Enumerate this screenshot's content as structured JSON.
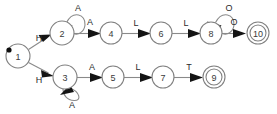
{
  "diagram": {
    "type": "state-machine",
    "background_color": "#ffffff",
    "node_stroke_color": "#808080",
    "edge_stroke_color": "#8a8a8a",
    "arrow_color": "#141414",
    "label_color": "#2a2a2a",
    "start_state": "1",
    "accepting_states": [
      "9",
      "10"
    ],
    "nodes": [
      {
        "id": "1",
        "label": "1",
        "cx": 18,
        "cy": 56,
        "r": 12,
        "accepting": false,
        "start": true
      },
      {
        "id": "2",
        "label": "2",
        "cx": 62,
        "cy": 33,
        "r": 12,
        "accepting": false,
        "start": false
      },
      {
        "id": "3",
        "label": "3",
        "cx": 65,
        "cy": 77,
        "r": 12,
        "accepting": false,
        "start": false
      },
      {
        "id": "4",
        "label": "4",
        "cx": 111,
        "cy": 33,
        "r": 11,
        "accepting": false,
        "start": false
      },
      {
        "id": "5",
        "label": "5",
        "cx": 113,
        "cy": 77,
        "r": 11,
        "accepting": false,
        "start": false
      },
      {
        "id": "6",
        "label": "6",
        "cx": 161,
        "cy": 33,
        "r": 11,
        "accepting": false,
        "start": false
      },
      {
        "id": "7",
        "label": "7",
        "cx": 163,
        "cy": 77,
        "r": 11,
        "accepting": false,
        "start": false
      },
      {
        "id": "8",
        "label": "8",
        "cx": 211,
        "cy": 33,
        "r": 11,
        "accepting": false,
        "start": false
      },
      {
        "id": "9",
        "label": "9",
        "cx": 214,
        "cy": 77,
        "r": 11,
        "accepting": true,
        "start": false
      },
      {
        "id": "10",
        "label": "10",
        "cx": 258,
        "cy": 33,
        "r": 11,
        "accepting": true,
        "start": false
      }
    ],
    "edges": [
      {
        "from": "1",
        "to": "2",
        "label": "H",
        "label_x": 39,
        "label_y": 38,
        "kind": "straight"
      },
      {
        "from": "1",
        "to": "3",
        "label": "H",
        "label_x": 39,
        "label_y": 80,
        "kind": "straight"
      },
      {
        "from": "2",
        "to": "2",
        "label": "A",
        "label_x": 78,
        "label_y": 8,
        "kind": "self-loop-up"
      },
      {
        "from": "2",
        "to": "4",
        "label": "A",
        "label_x": 90,
        "label_y": 22,
        "kind": "straight"
      },
      {
        "from": "4",
        "to": "6",
        "label": "L",
        "label_x": 136,
        "label_y": 23,
        "kind": "straight"
      },
      {
        "from": "6",
        "to": "8",
        "label": "L",
        "label_x": 186,
        "label_y": 23,
        "kind": "straight"
      },
      {
        "from": "8",
        "to": "8",
        "label": "O",
        "label_x": 229,
        "label_y": 8,
        "kind": "self-loop-up"
      },
      {
        "from": "8",
        "to": "10",
        "label": "O",
        "label_x": 234,
        "label_y": 22,
        "kind": "straight"
      },
      {
        "from": "3",
        "to": "3",
        "label": "A",
        "label_x": 72,
        "label_y": 105,
        "kind": "self-loop-down"
      },
      {
        "from": "3",
        "to": "5",
        "label": "A",
        "label_x": 92,
        "label_y": 67,
        "kind": "straight"
      },
      {
        "from": "5",
        "to": "7",
        "label": "L",
        "label_x": 138,
        "label_y": 67,
        "kind": "straight"
      },
      {
        "from": "7",
        "to": "9",
        "label": "T",
        "label_x": 189,
        "label_y": 67,
        "kind": "straight"
      }
    ],
    "start_marker": {
      "cx": 9,
      "cy": 50,
      "r": 2.6
    }
  }
}
